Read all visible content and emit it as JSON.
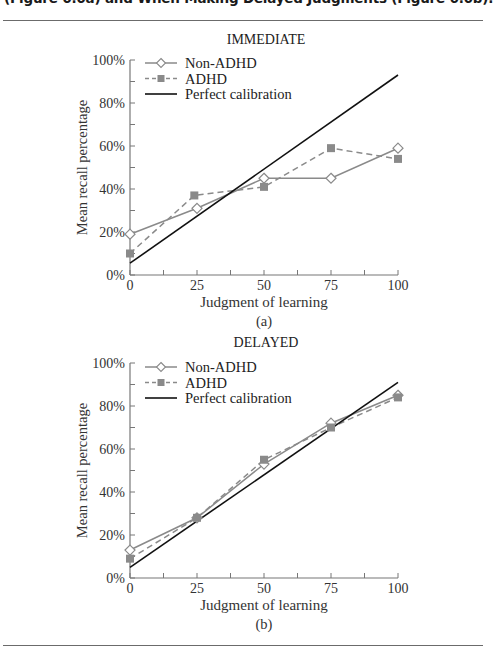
{
  "caption": {
    "line_partial": "(Figure 6.6a) and When Making Delayed Judgments (Figure 6.6b)."
  },
  "chart_data": [
    {
      "type": "line",
      "panel_label": "(a)",
      "title": "IMMEDIATE",
      "xlabel": "Judgment of learning",
      "ylabel": "Mean recall percentage",
      "x": [
        0,
        25,
        50,
        75,
        100
      ],
      "xticks": [
        "0",
        "25",
        "50",
        "75",
        "100"
      ],
      "yticks": [
        "0%",
        "20%",
        "40%",
        "60%",
        "80%",
        "100%"
      ],
      "ylim": [
        0,
        100
      ],
      "xlim": [
        0,
        100
      ],
      "grid": false,
      "legend_position": "upper left",
      "series": [
        {
          "name": "Non-ADHD",
          "style": "solid",
          "marker": "open-diamond",
          "x": [
            0,
            25,
            50,
            75,
            100
          ],
          "values": [
            19,
            31,
            45,
            45,
            59
          ]
        },
        {
          "name": "ADHD",
          "style": "dashed",
          "marker": "filled-square",
          "x": [
            0,
            24,
            50,
            75,
            100
          ],
          "values": [
            10,
            37,
            41,
            59,
            54
          ]
        },
        {
          "name": "Perfect calibration",
          "style": "solid-black",
          "marker": "none",
          "x": [
            0,
            100
          ],
          "values": [
            5.5,
            93
          ]
        }
      ]
    },
    {
      "type": "line",
      "panel_label": "(b)",
      "title": "DELAYED",
      "xlabel": "Judgment of learning",
      "ylabel": "Mean recall percentage",
      "x": [
        0,
        25,
        50,
        75,
        100
      ],
      "xticks": [
        "0",
        "25",
        "50",
        "75",
        "100"
      ],
      "yticks": [
        "0%",
        "20%",
        "40%",
        "60%",
        "80%",
        "100%"
      ],
      "ylim": [
        0,
        100
      ],
      "xlim": [
        0,
        100
      ],
      "grid": false,
      "legend_position": "upper left",
      "series": [
        {
          "name": "Non-ADHD",
          "style": "solid",
          "marker": "open-diamond",
          "x": [
            0,
            25,
            50,
            75,
            100
          ],
          "values": [
            13,
            28,
            53,
            72,
            85
          ]
        },
        {
          "name": "ADHD",
          "style": "dashed",
          "marker": "filled-square",
          "x": [
            0,
            25,
            50,
            75,
            100
          ],
          "values": [
            9,
            28,
            55,
            70,
            84
          ]
        },
        {
          "name": "Perfect calibration",
          "style": "solid-black",
          "marker": "none",
          "x": [
            0,
            100
          ],
          "values": [
            5,
            91
          ]
        }
      ]
    }
  ],
  "colors": {
    "series_gray": "#8a8a8a",
    "calibration": "#111111",
    "axis": "#777777",
    "rule": "#6b6b6b"
  }
}
